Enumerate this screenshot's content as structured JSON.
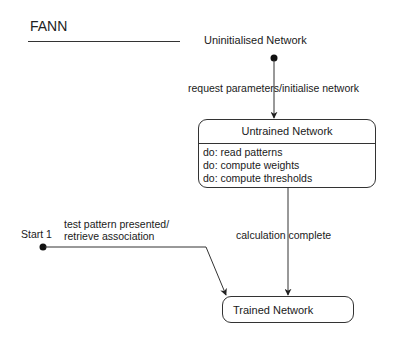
{
  "diagram": {
    "title": "FANN",
    "type": "UML state machine",
    "initial_states": [
      {
        "id": "init_top",
        "label": "Uninitialised Network"
      },
      {
        "id": "start_1",
        "label": "Start 1"
      }
    ],
    "states": [
      {
        "id": "untrained",
        "name": "Untrained Network",
        "activities": [
          "do: read patterns",
          "do: compute weights",
          "do: compute thresholds"
        ]
      },
      {
        "id": "trained",
        "name": "Trained Network"
      }
    ],
    "transitions": [
      {
        "from": "init_top",
        "to": "untrained",
        "label": "request parameters/initialise network"
      },
      {
        "from": "untrained",
        "to": "trained",
        "label": "calculation complete"
      },
      {
        "from": "start_1",
        "to": "trained",
        "label_line1": "test pattern presented/",
        "label_line2": "retrieve association"
      }
    ]
  }
}
